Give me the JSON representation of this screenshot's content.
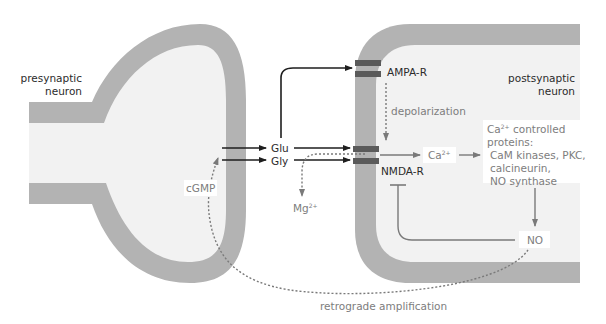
{
  "diagram": {
    "colors": {
      "membrane": "#b3b3b3",
      "cytoplasm": "#f2f2f2",
      "receptor": "#5a5a5a",
      "arrow_dark": "#1e1e1e",
      "arrow_grey": "#7a7a7a",
      "text_dark": "#2b2b2b",
      "text_grey": "#808080"
    },
    "cells": {
      "presynaptic": {
        "label_line1": "presynaptic",
        "label_line2": "neuron"
      },
      "postsynaptic": {
        "label_line1": "postsynaptic",
        "label_line2": "neuron"
      }
    },
    "receptors": {
      "ampa": {
        "label": "AMPA-R"
      },
      "nmda": {
        "label": "NMDA-R"
      }
    },
    "ligands": {
      "glu": "Glu",
      "gly": "Gly"
    },
    "labels": {
      "depolarization": "depolarization",
      "mg_base": "Mg",
      "mg_sup": "2+",
      "ca_base": "Ca",
      "ca_sup": "2+",
      "ca_proteins_head_base": "Ca",
      "ca_proteins_head_sup": "2+",
      "ca_proteins_head_rest": " controlled",
      "ca_proteins_line2": "proteins:",
      "ca_proteins_line3": "CaM kinases, PKC,",
      "ca_proteins_line4": "calcineurin,",
      "ca_proteins_line5": "NO synthase",
      "no": "NO",
      "cgmp": "cGMP",
      "retrograde": "retrograde amplification"
    }
  }
}
